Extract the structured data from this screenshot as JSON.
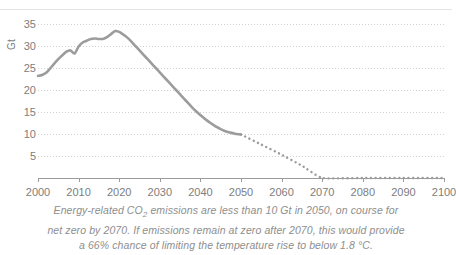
{
  "chart_data": {
    "type": "line",
    "title": "",
    "xlabel": "",
    "ylabel": "Gt",
    "ylim": [
      0,
      37
    ],
    "xlim": [
      2000,
      2100
    ],
    "grid": true,
    "legend": false,
    "y_unit_label": "Gt",
    "y_ticks": [
      35,
      30,
      25,
      20,
      15,
      10,
      5
    ],
    "x_ticks": [
      2000,
      2010,
      2020,
      2030,
      2040,
      2050,
      2060,
      2070,
      2080,
      2090,
      2100
    ],
    "line_color": "#9c9c9c",
    "grid_color": "#c9cbcd",
    "axis_color": "#9b9b9b",
    "text_color": "#7d7d7d",
    "series": [
      {
        "name": "Energy-related CO2 emissions (historical and projected)",
        "style": "solid",
        "x": [
          2000,
          2001,
          2002,
          2003,
          2004,
          2005,
          2006,
          2007,
          2008,
          2009,
          2010,
          2011,
          2012,
          2013,
          2014,
          2015,
          2016,
          2017,
          2018,
          2019,
          2020,
          2021,
          2022,
          2023,
          2024,
          2025,
          2026,
          2027,
          2028,
          2029,
          2030,
          2031,
          2032,
          2033,
          2034,
          2035,
          2036,
          2037,
          2038,
          2039,
          2040,
          2041,
          2042,
          2043,
          2044,
          2045,
          2046,
          2047,
          2048,
          2049,
          2050
        ],
        "y": [
          23.2,
          23.4,
          23.9,
          24.9,
          26.0,
          27.0,
          27.9,
          28.7,
          29.0,
          28.3,
          29.9,
          30.8,
          31.2,
          31.6,
          31.7,
          31.6,
          31.6,
          32.0,
          32.7,
          33.4,
          33.2,
          32.6,
          31.9,
          31.0,
          30.0,
          29.0,
          28.0,
          27.0,
          26.0,
          25.0,
          24.0,
          23.0,
          22.0,
          21.0,
          20.0,
          19.0,
          18.0,
          17.0,
          16.0,
          15.1,
          14.3,
          13.5,
          12.8,
          12.2,
          11.6,
          11.1,
          10.7,
          10.4,
          10.2,
          10.0,
          9.9
        ]
      },
      {
        "name": "Net zero pathway (projection)",
        "style": "dotted",
        "x": [
          2050,
          2055,
          2060,
          2065,
          2070,
          2080,
          2090,
          2100
        ],
        "y": [
          9.9,
          7.6,
          5.3,
          2.8,
          0.0,
          0.0,
          0.0,
          0.0
        ]
      }
    ],
    "caption_lines": [
      "Energy-related CO₂ emissions are less than 10 Gt in 2050, on course for",
      "net zero by 2070. If emissions remain at zero after 2070, this would provide",
      "a 66% chance of limiting the temperature rise to below 1.8 °C."
    ]
  },
  "caption": {
    "line1_a": "Energy-related CO",
    "line1_sub": "2",
    "line1_b": " emissions are less than 10 Gt in 2050, on course for",
    "line2": "net zero by 2070. If emissions remain at zero after 2070, this would provide",
    "line3": "a 66% chance of limiting the temperature rise to below 1.8 °C."
  }
}
